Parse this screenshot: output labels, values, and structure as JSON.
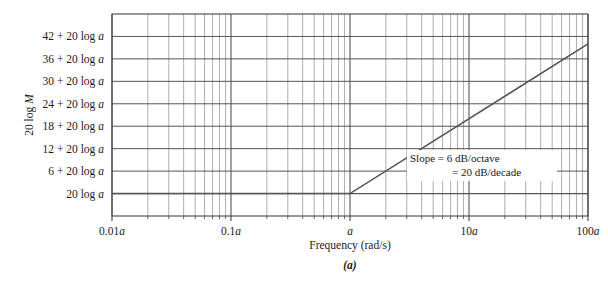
{
  "figure": {
    "caption": "(a)",
    "background": "#ffffff",
    "ink_color": "#333333",
    "grid_major_color": "#555555",
    "grid_minor_color": "#999999",
    "curve_color": "#555555"
  },
  "axes": {
    "y_title": "20 log M",
    "x_title": "Frequency (rad/s)",
    "y_labels": [
      "42 + 20 log a",
      "36 + 20 log a",
      "30 + 20 log a",
      "24 + 20 log a",
      "18 + 20 log a",
      "12 + 20 log a",
      "6 + 20 log a",
      "20 log a"
    ],
    "x_labels": [
      "0.01a",
      "0.1a",
      "a",
      "10a",
      "100a"
    ]
  },
  "annotation": {
    "line1": "Slope =   6 dB/octave",
    "line2": "=  20 dB/decade"
  },
  "chart_data": {
    "type": "line",
    "title": "",
    "subtitle": "(a)",
    "xlabel": "Frequency (rad/s)",
    "ylabel": "20 log M",
    "xscale": "log",
    "xlim": [
      0.01,
      100
    ],
    "ylim": [
      -6,
      48
    ],
    "grid": true,
    "legend": null,
    "xticks": [
      0.01,
      0.1,
      1,
      10,
      100
    ],
    "xticklabels": [
      "0.01a",
      "0.1a",
      "a",
      "10a",
      "100a"
    ],
    "yticks": [
      0,
      6,
      12,
      18,
      24,
      30,
      36,
      42
    ],
    "yticklabels": [
      "20 log a",
      "6 + 20 log a",
      "12 + 20 log a",
      "18 + 20 log a",
      "24 + 20 log a",
      "30 + 20 log a",
      "36 + 20 log a",
      "42 + 20 log a"
    ],
    "series": [
      {
        "name": "asymptotic magnitude",
        "x": [
          0.01,
          1,
          100
        ],
        "y": [
          0,
          0,
          40
        ],
        "description": "flat at 20 log a until break frequency a, then rising 20 dB/decade"
      }
    ],
    "annotations": [
      {
        "text": "Slope =   6 dB/octave\n=  20 dB/decade",
        "x": 4.0,
        "y": 9.5
      }
    ],
    "break_frequency": {
      "x": 1,
      "label": "a",
      "y": 0
    }
  }
}
